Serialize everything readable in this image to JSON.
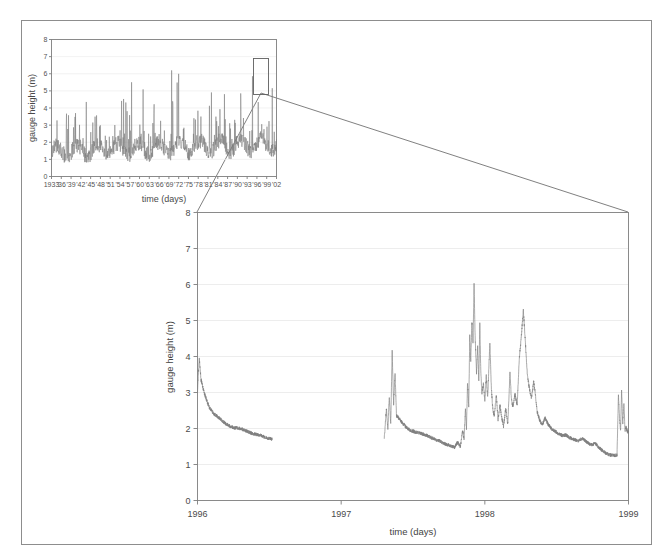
{
  "figure": {
    "name": "gauge-height-figure",
    "background": "#ffffff",
    "border_color": "#8d8d8d",
    "line_color": "#7b7b7b",
    "grid_color": "#e8e8e8"
  },
  "inset_chart": {
    "title": "",
    "ylabel": "gauge height (m)",
    "xlabel": "time (days)",
    "ytick_labels": [
      "0",
      "1",
      "2",
      "3",
      "4",
      "5",
      "6",
      "7",
      "8"
    ],
    "xtick_labels": [
      "1933",
      "'36",
      "'39",
      "'42",
      "'45",
      "'48",
      "'51",
      "'54",
      "'57",
      "'60",
      "'63",
      "'66",
      "'69",
      "'72",
      "'75",
      "'78",
      "'81",
      "'84",
      "'87",
      "'90",
      "'93",
      "'96",
      "'99",
      "'02"
    ]
  },
  "main_chart": {
    "ylabel": "gauge height (m)",
    "xlabel": "time (days)",
    "ytick_labels": [
      "0",
      "1",
      "2",
      "3",
      "4",
      "5",
      "6",
      "7",
      "8"
    ],
    "xtick_labels": [
      "1996",
      "1997",
      "1998",
      "1999"
    ]
  },
  "annotations": {
    "zoom_box_label": "zoom-region-1996-1999",
    "connector_label": "zoom-connector-lines"
  },
  "chart_data": [
    {
      "id": "inset",
      "type": "line",
      "title": "",
      "xlabel": "time (days)",
      "ylabel": "gauge height (m)",
      "xlim": [
        1933,
        2002
      ],
      "ylim": [
        0,
        8
      ],
      "grid": true,
      "legend": "none",
      "xticks": [
        1933,
        1936,
        1939,
        1942,
        1945,
        1948,
        1951,
        1954,
        1957,
        1960,
        1963,
        1966,
        1969,
        1972,
        1975,
        1978,
        1981,
        1984,
        1987,
        1990,
        1993,
        1996,
        1999,
        2002
      ],
      "xticklabels": [
        "1933",
        "'36",
        "'39",
        "'42",
        "'45",
        "'48",
        "'51",
        "'54",
        "'57",
        "'60",
        "'63",
        "'66",
        "'69",
        "'72",
        "'75",
        "'78",
        "'81",
        "'84",
        "'87",
        "'90",
        "'93",
        "'96",
        "'99",
        "'02"
      ],
      "yticks": [
        0,
        1,
        2,
        3,
        4,
        5,
        6,
        7,
        8
      ],
      "description": "Daily gauge height 1933-2002, highly spiky baseflow ~0.5-1.5 m with flood peaks to 5-7 m",
      "baseline": 1.0,
      "peak_max": 6.8,
      "seed": 11,
      "n_points": 900
    },
    {
      "id": "main",
      "type": "line",
      "title": "",
      "xlabel": "time (days)",
      "ylabel": "gauge height (m)",
      "xlim": [
        1996,
        1999
      ],
      "ylim": [
        0,
        8
      ],
      "grid": true,
      "legend": "none",
      "xticks": [
        1996,
        1997,
        1998,
        1999
      ],
      "xticklabels": [
        "1996",
        "1997",
        "1998",
        "1999"
      ],
      "yticks": [
        0,
        1,
        2,
        3,
        4,
        5,
        6,
        7,
        8
      ],
      "description": "Zoomed detail 1996-1999 with data gaps; recession from 4 m in early 1996 to ~1.7 m, gap mid-1996 to early-1997, flood peaks ~4.2 m in 1997.35, major peak 6.05 m near 1997.9, 5.3 m near 1998.4, recession to 1.25 m, spikes to 3.1 m at 1998.95",
      "gaps": [
        [
          1996.52,
          1997.3
        ]
      ],
      "peaks": [
        {
          "x": 1996.02,
          "y": 4.0
        },
        {
          "x": 1997.35,
          "y": 4.2
        },
        {
          "x": 1997.9,
          "y": 6.05
        },
        {
          "x": 1998.05,
          "y": 5.0
        },
        {
          "x": 1998.4,
          "y": 5.3
        },
        {
          "x": 1998.95,
          "y": 3.1
        }
      ],
      "minimum": 1.25,
      "seed": 7
    }
  ]
}
